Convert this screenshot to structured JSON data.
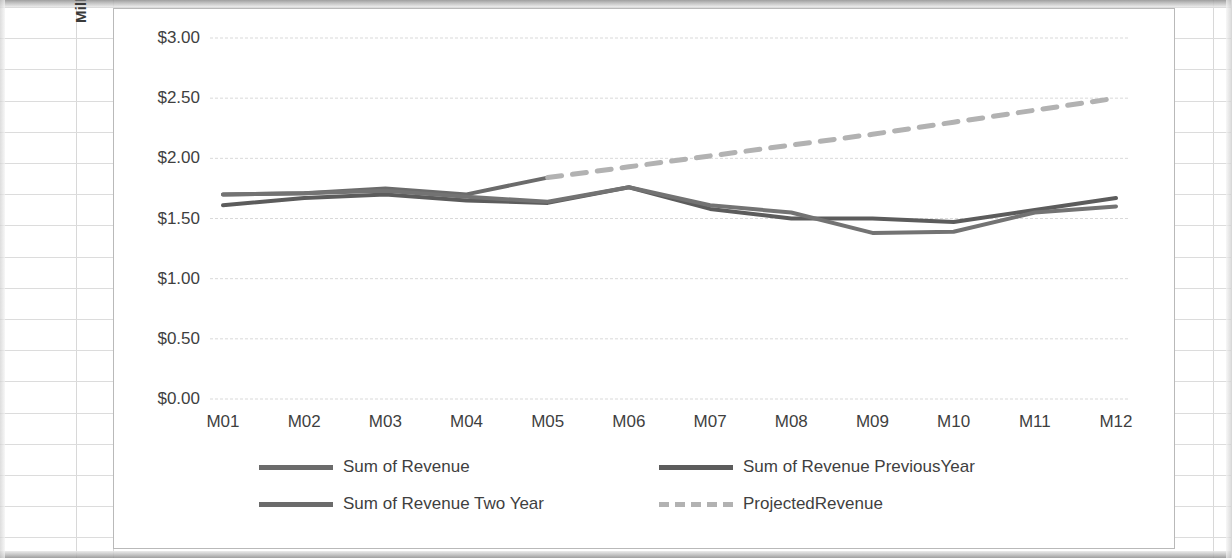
{
  "chart_data": {
    "type": "line",
    "title": "",
    "xlabel": "",
    "ylabel": "Millions",
    "categories": [
      "M01",
      "M02",
      "M03",
      "M04",
      "M05",
      "M06",
      "M07",
      "M08",
      "M09",
      "M10",
      "M11",
      "M12"
    ],
    "ylim": [
      0,
      3
    ],
    "ytick_values": [
      0,
      0.5,
      1,
      1.5,
      2,
      2.5,
      3
    ],
    "ytick_labels": [
      "$0.00",
      "$0.50",
      "$1.00",
      "$1.50",
      "$2.00",
      "$2.50",
      "$3.00"
    ],
    "grid": true,
    "legend_position": "bottom",
    "series": [
      {
        "name": "Sum of Revenue",
        "color": "#6b6b6b",
        "style": "solid",
        "values": [
          1.7,
          1.71,
          1.75,
          1.7,
          1.84,
          null,
          null,
          null,
          null,
          null,
          null,
          null
        ]
      },
      {
        "name": "Sum of Revenue PreviousYear",
        "color": "#5c5c5c",
        "style": "solid",
        "values": [
          1.61,
          1.67,
          1.7,
          1.65,
          1.63,
          1.76,
          1.58,
          1.5,
          1.5,
          1.47,
          1.57,
          1.67
        ]
      },
      {
        "name": "Sum of Revenue Two Year",
        "color": "#737373",
        "style": "solid",
        "values": [
          1.7,
          1.71,
          1.73,
          1.68,
          1.64,
          1.76,
          1.61,
          1.55,
          1.38,
          1.39,
          1.55,
          1.6
        ]
      },
      {
        "name": "ProjectedRevenue",
        "color": "#b2b2b2",
        "style": "dashed",
        "values": [
          null,
          null,
          null,
          null,
          1.84,
          1.93,
          2.02,
          2.11,
          2.2,
          2.3,
          2.4,
          2.5
        ]
      }
    ]
  },
  "legend": {
    "items": [
      {
        "label": "Sum of Revenue",
        "style": "solid",
        "color": "#6b6b6b"
      },
      {
        "label": "Sum of Revenue PreviousYear",
        "style": "solid",
        "color": "#5c5c5c"
      },
      {
        "label": "Sum of Revenue Two Year",
        "style": "solid",
        "color": "#737373"
      },
      {
        "label": "ProjectedRevenue",
        "style": "dashed",
        "color": "#b2b2b2"
      }
    ]
  },
  "colors": {
    "gridline": "#d9d9d9",
    "text": "#3f3f3f",
    "chart_border": "#b9b9b9",
    "sheet_grid": "#d8d8d8"
  }
}
